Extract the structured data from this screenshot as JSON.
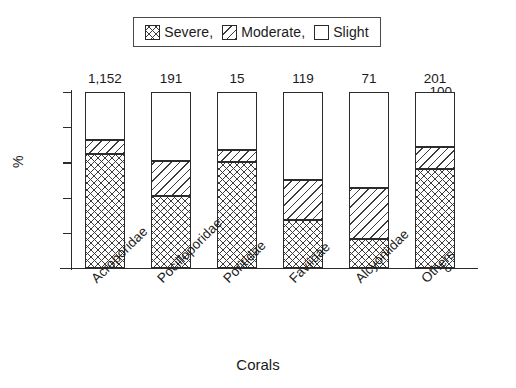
{
  "chart_data": {
    "type": "bar",
    "subtype": "stacked-bar",
    "title": "",
    "xlabel": "Corals",
    "ylabel": "%",
    "ylim": [
      0,
      100
    ],
    "yticks": [
      0,
      20,
      40,
      60,
      80,
      100
    ],
    "ytick_labels": [
      "0",
      "20",
      "40",
      "60",
      "80",
      "100"
    ],
    "grid": false,
    "legend_position": "top-center",
    "categories": [
      "Acroporidae",
      "Pocilloporidae",
      "Poritidae",
      "Faviidae",
      "Alcyoniidae",
      "Others"
    ],
    "bar_counts": [
      "1,152",
      "191",
      "15",
      "119",
      "71",
      "201"
    ],
    "series": [
      {
        "name": "Severe,",
        "pattern": "cross-hatch",
        "values": [
          65,
          41,
          60,
          27,
          16.5,
          56
        ]
      },
      {
        "name": "Moderate,",
        "pattern": "diagonal-hatch",
        "values": [
          8,
          20,
          7,
          23,
          29,
          13
        ]
      },
      {
        "name": "Slight",
        "pattern": "empty",
        "values": [
          27,
          39,
          33,
          50,
          54.5,
          31
        ]
      }
    ],
    "cumulative_tops": {
      "severe": [
        65,
        41,
        60,
        27,
        16.5,
        56
      ],
      "moderate": [
        73,
        61,
        67,
        50,
        45.5,
        69
      ],
      "slight": [
        100,
        100,
        100,
        100,
        100,
        100
      ]
    }
  },
  "legend": {
    "items": [
      {
        "label": "Severe,",
        "icon": "cross-hatch-swatch-icon"
      },
      {
        "label": "Moderate,",
        "icon": "diagonal-hatch-swatch-icon"
      },
      {
        "label": "Slight",
        "icon": "empty-swatch-icon"
      }
    ]
  },
  "axes": {
    "y_title": "%",
    "x_title": "Corals",
    "y_tick_labels": [
      "100",
      "80",
      "60",
      "40",
      "20",
      "0"
    ]
  },
  "colors": {
    "ink": "#2b2b2b",
    "background": "#ffffff",
    "hatch": "#3b3b3b"
  }
}
